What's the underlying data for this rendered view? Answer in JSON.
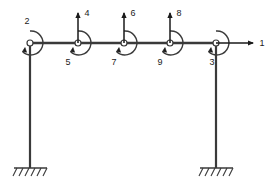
{
  "diagram": {
    "type": "structural-frame",
    "colors": {
      "member": "#3a3a3a",
      "joint_fill": "#ffffff",
      "label": "#1a1a1a",
      "background": "#ffffff"
    },
    "geometry": {
      "beam_y": 43,
      "beam_x_start": 30,
      "beam_x_end": 216,
      "column_bottom_y": 168,
      "left_column_x": 30,
      "right_column_x": 216
    },
    "joints": [
      {
        "id": "joint-left-top",
        "cx": 30,
        "cy": 43,
        "r": 3
      },
      {
        "id": "joint-b",
        "cx": 78,
        "cy": 43,
        "r": 3
      },
      {
        "id": "joint-c",
        "cx": 124,
        "cy": 43,
        "r": 3
      },
      {
        "id": "joint-d",
        "cx": 170,
        "cy": 43,
        "r": 3
      },
      {
        "id": "joint-right-top",
        "cx": 216,
        "cy": 43,
        "r": 3
      }
    ],
    "dof_arrows": [
      {
        "number": "1",
        "kind": "translation-horizontal",
        "direction": "right",
        "at_joint": "joint-right-top",
        "label_x": 262,
        "label_y": 46
      },
      {
        "number": "2",
        "kind": "rotation",
        "direction": "counterclockwise",
        "at_joint": "joint-left-top",
        "label_x": 27,
        "label_y": 24
      },
      {
        "number": "3",
        "kind": "rotation",
        "direction": "counterclockwise",
        "at_joint": "joint-right-top",
        "label_x": 212,
        "label_y": 65
      },
      {
        "number": "4",
        "kind": "translation-vertical",
        "direction": "up",
        "at_joint": "joint-b",
        "label_x": 87,
        "label_y": 16
      },
      {
        "number": "5",
        "kind": "rotation",
        "direction": "counterclockwise",
        "at_joint": "joint-b",
        "label_x": 68,
        "label_y": 65
      },
      {
        "number": "6",
        "kind": "translation-vertical",
        "direction": "up",
        "at_joint": "joint-c",
        "label_x": 133,
        "label_y": 16
      },
      {
        "number": "7",
        "kind": "rotation",
        "direction": "counterclockwise",
        "at_joint": "joint-c",
        "label_x": 114,
        "label_y": 65
      },
      {
        "number": "8",
        "kind": "translation-vertical",
        "direction": "up",
        "at_joint": "joint-d",
        "label_x": 179,
        "label_y": 16
      },
      {
        "number": "9",
        "kind": "rotation",
        "direction": "counterclockwise",
        "at_joint": "joint-d",
        "label_x": 160,
        "label_y": 65
      }
    ],
    "supports": [
      {
        "id": "support-left",
        "kind": "fixed",
        "x": 30,
        "y": 168
      },
      {
        "id": "support-right",
        "kind": "fixed",
        "x": 216,
        "y": 168
      }
    ],
    "labels": {
      "n1": "1",
      "n2": "2",
      "n3": "3",
      "n4": "4",
      "n5": "5",
      "n6": "6",
      "n7": "7",
      "n8": "8",
      "n9": "9"
    }
  }
}
